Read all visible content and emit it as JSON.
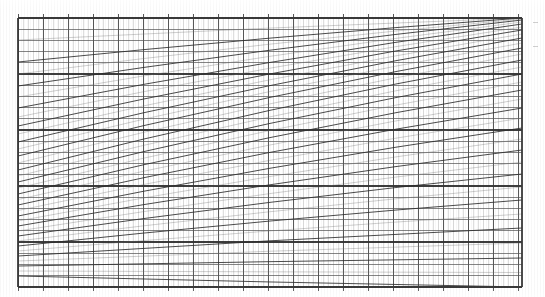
{
  "document": {
    "kind": "scanned-nomogram-grid",
    "background_color": "#ffffff",
    "width": 545,
    "height": 297
  },
  "chart_data": {
    "type": "line",
    "title": "",
    "subtitle": "",
    "xlabel": "",
    "ylabel": "",
    "grid": true,
    "legend_position": "none",
    "annotations": [],
    "plot_area": {
      "x": 18,
      "y": 18,
      "width": 504,
      "height": 269,
      "right": 522,
      "bottom": 287
    },
    "axes": {
      "x_range": [
        0,
        100
      ],
      "y_range": [
        0,
        100
      ],
      "x_tick_labels": [],
      "y_tick_labels": [],
      "ticks_outside_top": true,
      "ticks_outside_bottom": true
    },
    "grid_lines": {
      "vertical": {
        "count": 101,
        "minor_spacing_px": 5.0,
        "major_every": 5,
        "minor_color": "#b4b4b4",
        "major_color": "#4a4a4a",
        "minor_width_px": 0.7,
        "major_width_px": 1.0,
        "tick_overshoot_px": 4
      },
      "horizontal": {
        "count": 25,
        "spacing_px": 11.2,
        "color": "#555555",
        "width_px": 0.9,
        "major_every": 5,
        "major_color": "#333333"
      },
      "border": {
        "color": "#3a3a3a",
        "width_px": 1.2
      }
    },
    "series": [
      {
        "name": "fan-curve-1",
        "comment": "diagonal family radiating from a convergence point left of the plot, rising to the right",
        "left_y": 18,
        "right_y": 18
      },
      {
        "name": "fan-curve-2",
        "left_y": 62,
        "right_y": 18
      },
      {
        "name": "fan-curve-3",
        "left_y": 86,
        "right_y": 20
      },
      {
        "name": "fan-curve-4",
        "left_y": 108,
        "right_y": 24
      },
      {
        "name": "fan-curve-5",
        "left_y": 126,
        "right_y": 30
      },
      {
        "name": "fan-curve-6",
        "left_y": 142,
        "right_y": 38
      },
      {
        "name": "fan-curve-7",
        "left_y": 156,
        "right_y": 48
      },
      {
        "name": "fan-curve-8",
        "left_y": 170,
        "right_y": 60
      },
      {
        "name": "fan-curve-9",
        "left_y": 182,
        "right_y": 74
      },
      {
        "name": "fan-curve-10",
        "left_y": 194,
        "right_y": 90
      },
      {
        "name": "fan-curve-11",
        "left_y": 205,
        "right_y": 108
      },
      {
        "name": "fan-curve-12",
        "left_y": 216,
        "right_y": 128
      },
      {
        "name": "fan-curve-13",
        "left_y": 226,
        "right_y": 150
      },
      {
        "name": "fan-curve-14",
        "left_y": 236,
        "right_y": 174
      },
      {
        "name": "fan-curve-15",
        "left_y": 246,
        "right_y": 200
      },
      {
        "name": "fan-curve-16",
        "left_y": 256,
        "right_y": 228
      },
      {
        "name": "fan-curve-17",
        "left_y": 266,
        "right_y": 258
      },
      {
        "name": "fan-curve-18",
        "left_y": 276,
        "right_y": 287
      }
    ],
    "fan": {
      "curve_color": "#2e2e2e",
      "curve_width_px": 0.95,
      "intermediate_curves": 34,
      "intermediate_color": "#6e6e6e",
      "intermediate_width_px": 0.6
    },
    "margin_marks": {
      "present": true,
      "color": "#c8c8c8",
      "items": [
        {
          "x": 533,
          "y": 22,
          "length": 5
        },
        {
          "x": 533,
          "y": 46,
          "length": 5
        }
      ]
    }
  }
}
